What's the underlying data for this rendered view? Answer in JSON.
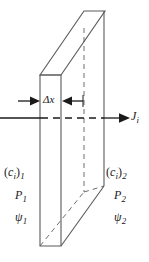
{
  "figure": {
    "stroke_color": "#5a5a5a",
    "line_color": "#1a1a1a",
    "text_color": "#1a1a1a",
    "background": "#ffffff"
  },
  "labels": {
    "thickness": {
      "symbol": "Δx"
    },
    "flux": {
      "base": "J",
      "sub": "i"
    },
    "left_side": {
      "concentration": {
        "open": "(",
        "base": "c",
        "base_sub": "i",
        "close": ")",
        "sub": "1"
      },
      "pressure": {
        "base": "P",
        "sub": "1"
      },
      "potential": {
        "base": "ψ",
        "sub": "1"
      }
    },
    "right_side": {
      "concentration": {
        "open": "(",
        "base": "c",
        "base_sub": "i",
        "close": ")",
        "sub": "2"
      },
      "pressure": {
        "base": "P",
        "sub": "2"
      },
      "potential": {
        "base": "ψ",
        "sub": "2"
      }
    }
  },
  "geometry": {
    "front_face": {
      "left": 40,
      "right": 61,
      "top": 75,
      "bottom": 246
    },
    "back_offset": {
      "dx": 44,
      "dy": -64
    },
    "hidden_vertical_x": 82,
    "axis_y": 118
  }
}
